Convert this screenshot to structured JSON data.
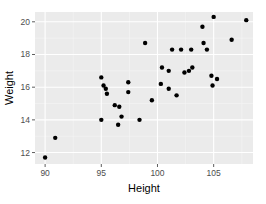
{
  "chart_data": {
    "type": "scatter",
    "title": "",
    "xlabel": "Height",
    "ylabel": "Weight",
    "xlim": [
      89.1,
      108.5
    ],
    "ylim": [
      11.3,
      20.6
    ],
    "x_ticks": [
      90,
      95,
      100,
      105
    ],
    "y_ticks": [
      12,
      14,
      16,
      18,
      20
    ],
    "grid": true,
    "legend": null,
    "theme": {
      "panel_bg": "#ebebeb",
      "grid_major": "#ffffff",
      "grid_minor": "#f5f5f5",
      "point_color": "#000000"
    },
    "points": [
      {
        "x": 90.0,
        "y": 11.7
      },
      {
        "x": 90.9,
        "y": 12.9
      },
      {
        "x": 95.0,
        "y": 16.6
      },
      {
        "x": 95.2,
        "y": 16.1
      },
      {
        "x": 95.4,
        "y": 15.9
      },
      {
        "x": 95.5,
        "y": 15.6
      },
      {
        "x": 97.4,
        "y": 16.3
      },
      {
        "x": 97.4,
        "y": 15.7
      },
      {
        "x": 96.2,
        "y": 14.9
      },
      {
        "x": 96.6,
        "y": 14.8
      },
      {
        "x": 96.8,
        "y": 14.2
      },
      {
        "x": 95.0,
        "y": 14.0
      },
      {
        "x": 96.5,
        "y": 13.7
      },
      {
        "x": 98.4,
        "y": 14.0
      },
      {
        "x": 99.5,
        "y": 15.2
      },
      {
        "x": 98.9,
        "y": 18.7
      },
      {
        "x": 101.3,
        "y": 18.3
      },
      {
        "x": 102.1,
        "y": 18.3
      },
      {
        "x": 103.0,
        "y": 18.3
      },
      {
        "x": 104.1,
        "y": 18.7
      },
      {
        "x": 104.4,
        "y": 18.3
      },
      {
        "x": 104.0,
        "y": 19.7
      },
      {
        "x": 105.0,
        "y": 20.3
      },
      {
        "x": 106.6,
        "y": 18.9
      },
      {
        "x": 107.9,
        "y": 20.1
      },
      {
        "x": 100.4,
        "y": 17.2
      },
      {
        "x": 101.0,
        "y": 17.0
      },
      {
        "x": 102.4,
        "y": 16.9
      },
      {
        "x": 102.8,
        "y": 17.0
      },
      {
        "x": 103.1,
        "y": 17.2
      },
      {
        "x": 100.3,
        "y": 16.2
      },
      {
        "x": 101.0,
        "y": 15.9
      },
      {
        "x": 101.7,
        "y": 15.5
      },
      {
        "x": 104.8,
        "y": 16.7
      },
      {
        "x": 105.3,
        "y": 16.5
      },
      {
        "x": 104.9,
        "y": 16.1
      }
    ]
  }
}
